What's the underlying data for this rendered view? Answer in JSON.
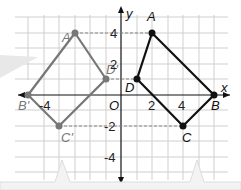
{
  "figure": {
    "axis_labels": {
      "x": "x",
      "y": "y",
      "origin": "O"
    },
    "tick_labels": {
      "x": [
        "-4",
        "2",
        "4"
      ],
      "y": [
        "4",
        "2",
        "-2",
        "-4"
      ]
    },
    "original": {
      "color": "#111111",
      "points": [
        {
          "name": "A",
          "x": 2,
          "y": 4
        },
        {
          "name": "B",
          "x": 6,
          "y": 0
        },
        {
          "name": "C",
          "x": 4,
          "y": -2
        },
        {
          "name": "D",
          "x": 1,
          "y": 1
        }
      ]
    },
    "image": {
      "color": "#777777",
      "points": [
        {
          "name": "A'",
          "x": -3,
          "y": 4
        },
        {
          "name": "B'",
          "x": -6,
          "y": 0
        },
        {
          "name": "C'",
          "x": -4,
          "y": -2
        },
        {
          "name": "D'",
          "x": -1,
          "y": 1
        }
      ]
    }
  }
}
